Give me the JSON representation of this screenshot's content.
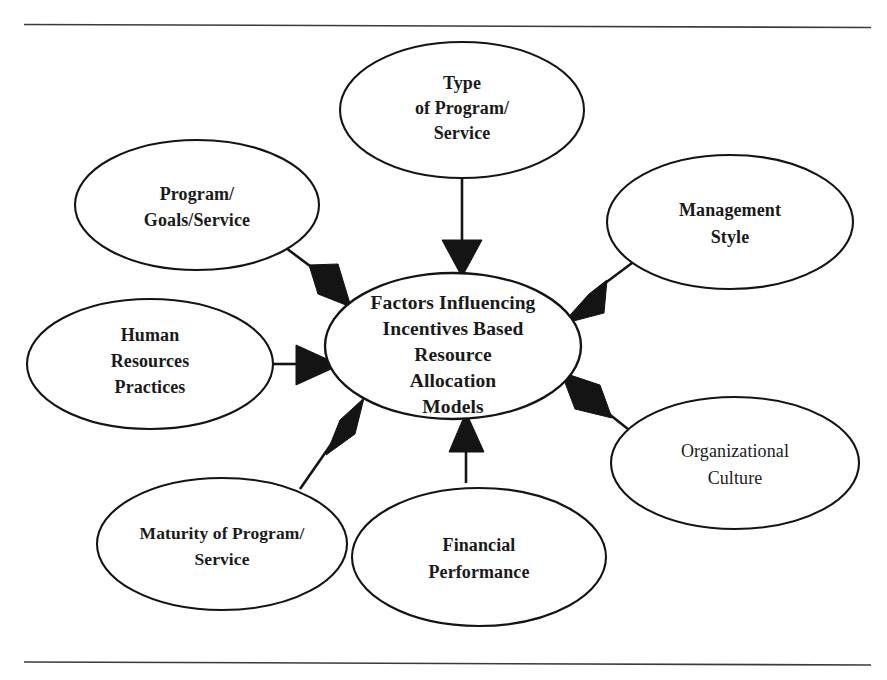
{
  "figure": {
    "title": "Factors Influencing Incentives Based Resource Allocation Models",
    "colors": {
      "ink": "#141414",
      "text": "#1a1a1a",
      "rule": "#3a3a42",
      "background": "#ffffff"
    },
    "rules": {
      "top_label": "top-horizontal-rule",
      "bottom_label": "bottom-horizontal-rule"
    }
  },
  "center_node": {
    "name": "factors-influencing-incentives-based-resource-allocation-models",
    "lines": [
      "Factors Influencing",
      "Incentives Based",
      "Resource",
      "Allocation",
      "Models"
    ]
  },
  "nodes": [
    {
      "name": "type-of-program-service",
      "position": "top",
      "lines": [
        "Type",
        "of Program/",
        "Service"
      ]
    },
    {
      "name": "program-goals-service",
      "position": "upper-left",
      "lines": [
        "Program/",
        "Goals/Service"
      ]
    },
    {
      "name": "human-resources-practices",
      "position": "left",
      "lines": [
        "Human",
        "Resources",
        "Practices"
      ]
    },
    {
      "name": "maturity-of-program-service",
      "position": "lower-left",
      "lines": [
        "Maturity of Program/",
        "Service"
      ]
    },
    {
      "name": "financial-performance",
      "position": "bottom",
      "lines": [
        "Financial",
        "Performance"
      ]
    },
    {
      "name": "organizational-culture",
      "position": "lower-right",
      "lines": [
        "Organizational",
        "Culture"
      ]
    },
    {
      "name": "management-style",
      "position": "upper-right",
      "lines": [
        "Management",
        "Style"
      ]
    }
  ],
  "arrows": [
    {
      "name": "arrow-type-of-program-service-to-center",
      "from": "type-of-program-service",
      "to": "center_node"
    },
    {
      "name": "arrow-program-goals-service-to-center",
      "from": "program-goals-service",
      "to": "center_node"
    },
    {
      "name": "arrow-human-resources-practices-to-center",
      "from": "human-resources-practices",
      "to": "center_node"
    },
    {
      "name": "arrow-maturity-of-program-service-to-center",
      "from": "maturity-of-program-service",
      "to": "center_node"
    },
    {
      "name": "arrow-financial-performance-to-center",
      "from": "financial-performance",
      "to": "center_node"
    },
    {
      "name": "arrow-organizational-culture-to-center",
      "from": "organizational-culture",
      "to": "center_node"
    },
    {
      "name": "arrow-management-style-to-center",
      "from": "management-style",
      "to": "center_node"
    }
  ]
}
